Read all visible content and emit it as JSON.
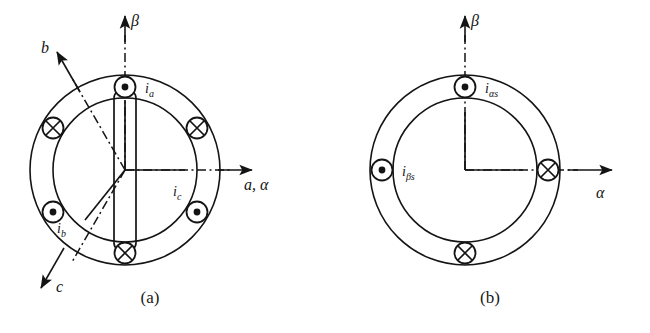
{
  "figure": {
    "colors": {
      "stroke": "#141414",
      "background": "#ffffff"
    },
    "captions": {
      "a": "(a)",
      "b": "(b)"
    }
  },
  "panel_a": {
    "name": "three-phase-stator-winding",
    "center": {
      "x": 125,
      "y": 170
    },
    "outer_radius": 95,
    "inner_radius": 72,
    "axes": [
      {
        "id": "alpha",
        "label": "a, α",
        "angle_deg": 0,
        "style": "dash-dot",
        "label_x": 245,
        "label_y": 185
      },
      {
        "id": "beta",
        "label": "β",
        "angle_deg": 90,
        "style": "dash-dot",
        "label_x": 131,
        "label_y": 24
      },
      {
        "id": "b",
        "label": "b",
        "angle_deg": 120,
        "style": "dash-dot",
        "label_x": 41,
        "label_y": 50
      },
      {
        "id": "c",
        "label": "c",
        "angle_deg": 240,
        "style": "dash-dot",
        "label_x": 56,
        "label_y": 289
      }
    ],
    "conductors": [
      {
        "id": "ia-dot",
        "symbol": "dot",
        "angle_deg": 90,
        "label": "i",
        "sub": "a",
        "label_x": 156,
        "label_y": 90
      },
      {
        "id": "cross-30",
        "symbol": "cross",
        "angle_deg": 30,
        "label": "",
        "sub": ""
      },
      {
        "id": "ic-dot",
        "symbol": "dot",
        "angle_deg": -30,
        "label": "i",
        "sub": "c",
        "label_x": 173,
        "label_y": 178
      },
      {
        "id": "cross-270",
        "symbol": "cross",
        "angle_deg": 270,
        "label": "",
        "sub": ""
      },
      {
        "id": "ib-dot",
        "symbol": "dot",
        "angle_deg": 210,
        "label": "i",
        "sub": "b",
        "label_x": 60,
        "label_y": 222
      },
      {
        "id": "cross-150",
        "symbol": "cross",
        "angle_deg": 150,
        "label": "",
        "sub": ""
      }
    ],
    "coil": {
      "description": "vertical phase-a coil spanning the dot conductor at top and the cross conductor at bottom",
      "present": true
    }
  },
  "panel_b": {
    "name": "two-phase-equivalent-winding",
    "center": {
      "x": 465,
      "y": 170
    },
    "outer_radius": 95,
    "inner_radius": 72,
    "axes": [
      {
        "id": "alpha",
        "label": "α",
        "angle_deg": 0,
        "style": "dash-dot",
        "label_x": 598,
        "label_y": 195
      },
      {
        "id": "beta",
        "label": "β",
        "angle_deg": 90,
        "style": "dash-dot",
        "label_x": 472,
        "label_y": 24
      }
    ],
    "conductors": [
      {
        "id": "ialphas-dot",
        "symbol": "dot",
        "angle_deg": 90,
        "label": "i",
        "sub": "αs",
        "label_x": 493,
        "label_y": 88
      },
      {
        "id": "cross-0",
        "symbol": "cross",
        "angle_deg": 0,
        "label": "",
        "sub": ""
      },
      {
        "id": "ibetas-dot",
        "symbol": "dot",
        "angle_deg": 180,
        "label": "i",
        "sub": "βs",
        "label_x": 406,
        "label_y": 180
      },
      {
        "id": "cross-270",
        "symbol": "cross",
        "angle_deg": 270,
        "label": "",
        "sub": ""
      }
    ],
    "coil": {
      "description": "right-angle connector from center to alpha-axis conductor and beta-axis conductor",
      "present": true
    }
  }
}
